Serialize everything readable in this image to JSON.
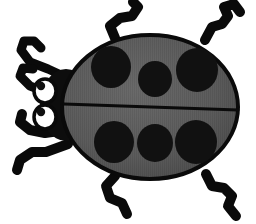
{
  "image": {
    "title": "Ladybug",
    "subject": "ladybug-beetle-clipart",
    "style": "flat-vector-silhouette",
    "width": 256,
    "height": 224,
    "background_color": "#ffffff",
    "alt_text": "Gray and black ladybug beetle with six black spots, two white eyes, two antennae and six legs"
  },
  "palette": {
    "background": "#ffffff",
    "outline": "#0a0a0a",
    "shell_fill": "#5c5c5c",
    "shell_shade": "#4a4a4a",
    "shell_highlight": "#6a6a6a",
    "spot_fill": "#111111",
    "head_fill": "#0d0d0d",
    "eye_white": "#ffffff",
    "pupil": "#101010",
    "leg_color": "#0a0a0a"
  },
  "body": {
    "name": "elytra-shell",
    "shape": "ellipse",
    "cx": 150,
    "cy": 107,
    "rx": 88,
    "ry": 72,
    "fill": "#5c5c5c",
    "stroke": "#0a0a0a",
    "stroke_width": 4
  },
  "wing_divider": {
    "name": "wing-seam",
    "orientation": "horizontal",
    "y_left": 104,
    "y_right": 110,
    "x_start": 64,
    "x_end": 238,
    "stroke_width": 3
  },
  "head": {
    "name": "head-thorax",
    "cx": 66,
    "cy": 105,
    "rx": 26,
    "ry": 36,
    "fill": "#0d0d0d"
  },
  "eyes": [
    {
      "name": "eye-upper",
      "cx": 45,
      "cy": 91,
      "rx": 11,
      "ry": 12,
      "pupil_cx": 41,
      "pupil_cy": 86,
      "pupil_r": 4.2
    },
    {
      "name": "eye-lower",
      "cx": 45,
      "cy": 117,
      "rx": 11,
      "ry": 12,
      "pupil_cx": 41,
      "pupil_cy": 112,
      "pupil_r": 4.2
    }
  ],
  "spots": {
    "count": 6,
    "upper_row": [
      {
        "name": "spot-upper-left",
        "cx": 111,
        "cy": 67,
        "rx": 20,
        "ry": 21
      },
      {
        "name": "spot-upper-middle",
        "cx": 155,
        "cy": 79,
        "rx": 17,
        "ry": 18
      },
      {
        "name": "spot-upper-right",
        "cx": 197,
        "cy": 70,
        "rx": 21,
        "ry": 22
      }
    ],
    "lower_row": [
      {
        "name": "spot-lower-left",
        "cx": 114,
        "cy": 142,
        "rx": 20,
        "ry": 21
      },
      {
        "name": "spot-lower-middle",
        "cx": 155,
        "cy": 143,
        "rx": 18,
        "ry": 19
      },
      {
        "name": "spot-lower-right",
        "cx": 196,
        "cy": 142,
        "rx": 21,
        "ry": 22
      }
    ]
  },
  "antennae": [
    {
      "name": "antenna-upper",
      "path": "M 72 80 L 48 69 L 30 62 L 21 50 L 24 41 L 34 41 L 41 48"
    },
    {
      "name": "antenna-lower",
      "path": "M 70 97 L 46 92 L 30 86 L 20 76 L 23 68 L 33 69"
    }
  ],
  "legs": [
    {
      "name": "leg-front-left",
      "side": "top-left",
      "path": "M 115 38 L 110 26 L 120 18 L 132 16 L 138 7 L 133 2"
    },
    {
      "name": "leg-front-right",
      "side": "top-right",
      "path": "M 205 40 L 212 27 L 222 24 L 228 16 L 224 7 L 234 4 L 240 12"
    },
    {
      "name": "leg-middle-left",
      "side": "bottom-left-upper",
      "path": "M 66 130 L 45 133 L 30 130 L 20 122 L 22 114"
    },
    {
      "name": "leg-middle-left-lower",
      "side": "bottom-left-lower",
      "path": "M 68 144 L 46 152 L 32 152 L 20 160 L 17 170"
    },
    {
      "name": "leg-rear-left",
      "side": "bottom-left",
      "path": "M 115 176 L 106 186 L 110 198 L 122 203 L 127 214"
    },
    {
      "name": "leg-rear-right",
      "side": "bottom-right",
      "path": "M 206 174 L 212 186 L 224 188 L 232 196 L 228 206 L 236 216"
    }
  ],
  "texture": {
    "name": "scanline-texture",
    "enabled": true,
    "direction": "vertical",
    "stripe_width": 1,
    "opacity": 0.07
  },
  "labels": {
    "canvas": "Ladybug illustration canvas",
    "body": "Beetle shell",
    "head": "Beetle head",
    "spots": "Shell spots",
    "legs": "Legs",
    "antennae": "Antennae",
    "eyes": "Eyes"
  }
}
